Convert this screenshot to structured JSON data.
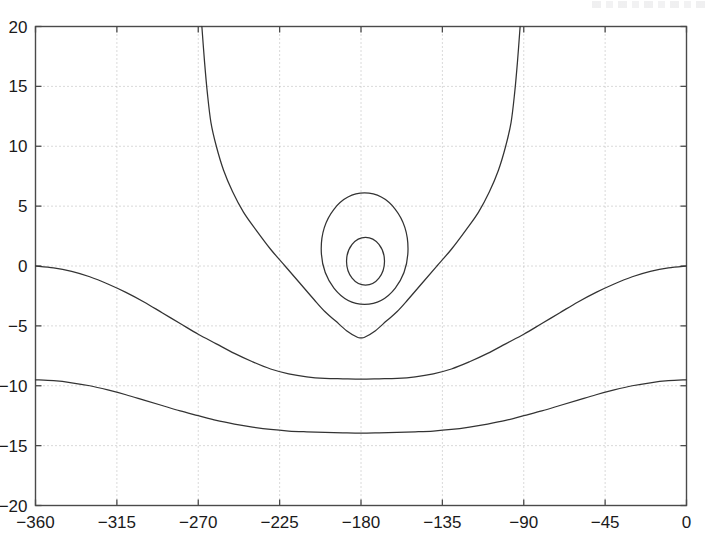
{
  "chart_data": {
    "type": "line",
    "title": "",
    "subtitle": "",
    "xlabel": "",
    "ylabel": "",
    "xlim": [
      -360,
      0
    ],
    "ylim": [
      -20,
      20
    ],
    "grid": true,
    "grid_style": "dotted",
    "legend": "none",
    "xticks": [
      -360,
      -315,
      -270,
      -225,
      -180,
      -135,
      -90,
      -45,
      0
    ],
    "xticklabels": [
      "-360",
      "-315",
      "-270",
      "-225",
      "-180",
      "-135",
      "-90",
      "-45",
      "0"
    ],
    "yticks": [
      -20,
      -15,
      -10,
      -5,
      0,
      5,
      10,
      15,
      20
    ],
    "yticklabels": [
      "-20",
      "-15",
      "-10",
      "-5",
      "0",
      "5",
      "10",
      "15",
      "20"
    ],
    "series": [
      {
        "name": "outer-open-branches",
        "type": "open-vertical-pair",
        "kind": "steep-branches",
        "center_x": -180,
        "vertex_y": -6.0,
        "half_width_at_top": 88,
        "points_left": [
          [
            -268,
            20
          ],
          [
            -266.5,
            17
          ],
          [
            -265,
            14.5
          ],
          [
            -263,
            12
          ],
          [
            -260,
            10
          ],
          [
            -256,
            8
          ],
          [
            -251,
            6.2
          ],
          [
            -245,
            4.5
          ],
          [
            -238,
            3.0
          ],
          [
            -230,
            1.4
          ],
          [
            -222,
            0.0
          ],
          [
            -214,
            -1.4
          ],
          [
            -206,
            -2.8
          ],
          [
            -200,
            -3.8
          ],
          [
            -194,
            -4.6
          ],
          [
            -188,
            -5.4
          ],
          [
            -182,
            -5.95
          ],
          [
            -180,
            -6.0
          ]
        ],
        "points_right": [
          [
            -180,
            -6.0
          ],
          [
            -178,
            -5.95
          ],
          [
            -172,
            -5.4
          ],
          [
            -166,
            -4.6
          ],
          [
            -160,
            -3.8
          ],
          [
            -154,
            -2.8
          ],
          [
            -146,
            -1.4
          ],
          [
            -138,
            0.0
          ],
          [
            -130,
            1.4
          ],
          [
            -122,
            3.0
          ],
          [
            -115,
            4.5
          ],
          [
            -109,
            6.2
          ],
          [
            -104,
            8
          ],
          [
            -100,
            10
          ],
          [
            -97,
            12
          ],
          [
            -95,
            14.5
          ],
          [
            -93.5,
            17
          ],
          [
            -92,
            20
          ]
        ]
      },
      {
        "name": "outer-closed-orbit",
        "type": "closed-loop",
        "center_x": -178,
        "center_y": 1.45,
        "top_y": 6.1,
        "bottom_y": -3.2,
        "left_x": -202,
        "right_x": -154
      },
      {
        "name": "inner-closed-orbit",
        "type": "closed-loop",
        "center_x": -178,
        "center_y": 0.45,
        "top_y": 2.4,
        "bottom_y": -1.6,
        "left_x": -188,
        "right_x": -167
      },
      {
        "name": "upper-wave-contour",
        "type": "open-wave",
        "edge_y": 0.0,
        "min_y": -9.4,
        "min_x": -180,
        "points": [
          [
            -360,
            0.0
          ],
          [
            -350,
            -0.15
          ],
          [
            -340,
            -0.45
          ],
          [
            -330,
            -0.9
          ],
          [
            -320,
            -1.5
          ],
          [
            -310,
            -2.2
          ],
          [
            -300,
            -3.0
          ],
          [
            -290,
            -3.9
          ],
          [
            -280,
            -4.8
          ],
          [
            -270,
            -5.7
          ],
          [
            -260,
            -6.5
          ],
          [
            -250,
            -7.3
          ],
          [
            -240,
            -8.0
          ],
          [
            -230,
            -8.6
          ],
          [
            -220,
            -9.0
          ],
          [
            -210,
            -9.25
          ],
          [
            -200,
            -9.38
          ],
          [
            -190,
            -9.42
          ],
          [
            -180,
            -9.45
          ],
          [
            -170,
            -9.42
          ],
          [
            -160,
            -9.38
          ],
          [
            -150,
            -9.25
          ],
          [
            -140,
            -9.0
          ],
          [
            -130,
            -8.6
          ],
          [
            -120,
            -8.0
          ],
          [
            -110,
            -7.3
          ],
          [
            -100,
            -6.5
          ],
          [
            -90,
            -5.7
          ],
          [
            -80,
            -4.8
          ],
          [
            -70,
            -3.9
          ],
          [
            -60,
            -3.0
          ],
          [
            -50,
            -2.2
          ],
          [
            -40,
            -1.5
          ],
          [
            -30,
            -0.9
          ],
          [
            -20,
            -0.45
          ],
          [
            -10,
            -0.15
          ],
          [
            0,
            0.0
          ]
        ]
      },
      {
        "name": "lower-wave-contour",
        "type": "open-wave",
        "edge_y": -9.5,
        "min_y": -13.9,
        "min_x": -180,
        "points": [
          [
            -360,
            -9.5
          ],
          [
            -350,
            -9.58
          ],
          [
            -340,
            -9.75
          ],
          [
            -330,
            -10.0
          ],
          [
            -320,
            -10.35
          ],
          [
            -310,
            -10.75
          ],
          [
            -300,
            -11.2
          ],
          [
            -290,
            -11.65
          ],
          [
            -280,
            -12.1
          ],
          [
            -270,
            -12.5
          ],
          [
            -260,
            -12.9
          ],
          [
            -250,
            -13.2
          ],
          [
            -240,
            -13.45
          ],
          [
            -230,
            -13.65
          ],
          [
            -220,
            -13.78
          ],
          [
            -210,
            -13.85
          ],
          [
            -200,
            -13.9
          ],
          [
            -190,
            -13.93
          ],
          [
            -180,
            -13.95
          ],
          [
            -170,
            -13.93
          ],
          [
            -160,
            -13.9
          ],
          [
            -150,
            -13.85
          ],
          [
            -140,
            -13.78
          ],
          [
            -130,
            -13.65
          ],
          [
            -120,
            -13.45
          ],
          [
            -110,
            -13.2
          ],
          [
            -100,
            -12.9
          ],
          [
            -90,
            -12.5
          ],
          [
            -80,
            -12.1
          ],
          [
            -70,
            -11.65
          ],
          [
            -60,
            -11.2
          ],
          [
            -50,
            -10.75
          ],
          [
            -40,
            -10.35
          ],
          [
            -30,
            -10.0
          ],
          [
            -20,
            -9.75
          ],
          [
            -10,
            -9.58
          ],
          [
            0,
            -9.5
          ]
        ]
      }
    ]
  },
  "style": {
    "curve_color": "#333333",
    "axis_color": "#4a4a4a",
    "grid_color": "#b4b4b4",
    "tick_label_color": "#1a1a1a",
    "background": "#ffffff"
  }
}
